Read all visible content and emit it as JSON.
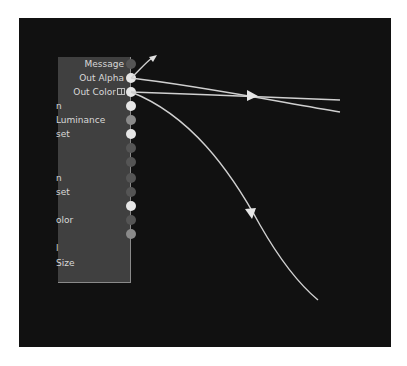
{
  "node": {
    "rows": [
      {
        "label": "Message",
        "align": "right",
        "port_color": "#555555",
        "y": 64
      },
      {
        "label": "Out Alpha",
        "align": "right",
        "port_color": "#e6e6e6",
        "y": 78
      },
      {
        "label": "Out Color",
        "align": "right",
        "port_color": "#e6e6e6",
        "y": 92,
        "compound": true
      },
      {
        "label": "n",
        "align": "left",
        "port_color": "#e6e6e6",
        "y": 106
      },
      {
        "label": "Luminance",
        "align": "left",
        "port_color": "#8a8a8a",
        "y": 120
      },
      {
        "label": "set",
        "align": "left",
        "port_color": "#e6e6e6",
        "y": 134
      },
      {
        "label": "",
        "align": "left",
        "port_color": "#555555",
        "y": 148
      },
      {
        "label": "",
        "align": "left",
        "port_color": "#555555",
        "y": 162
      },
      {
        "label": "n",
        "align": "left",
        "port_color": "#555555",
        "y": 178
      },
      {
        "label": "set",
        "align": "left",
        "port_color": "#555555",
        "y": 192
      },
      {
        "label": "",
        "align": "left",
        "port_color": "#e6e6e6",
        "y": 206
      },
      {
        "label": "olor",
        "align": "left",
        "port_color": "#555555",
        "y": 220
      },
      {
        "label": "",
        "align": "left",
        "port_color": "#8a8a8a",
        "y": 234
      },
      {
        "label": "l",
        "align": "left",
        "port_color": null,
        "y": 248
      },
      {
        "label": "Size",
        "align": "left",
        "port_color": null,
        "y": 263
      }
    ]
  },
  "connections": [
    {
      "from": "Out Alpha",
      "to": "offscreen-up",
      "arrow_at": [
        152,
        58
      ]
    },
    {
      "from": "Out Alpha",
      "to": "right",
      "end": [
        340,
        112
      ]
    },
    {
      "from": "Out Color",
      "to": "right",
      "end": [
        340,
        100
      ],
      "arrow_at": [
        252,
        96
      ]
    },
    {
      "from": "Out Color",
      "to": "down",
      "end": [
        318,
        300
      ],
      "arrow_at": [
        251,
        213
      ]
    }
  ],
  "colors": {
    "canvas": "#111111",
    "node_body": "#404040",
    "wire": "#d0d0d0",
    "label": "#d8d8d8"
  }
}
